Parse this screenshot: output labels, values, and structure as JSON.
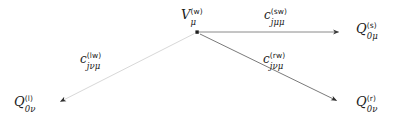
{
  "figure": {
    "kind": "node-link-diagram",
    "background_color": "#ffffff",
    "width": 397,
    "height": 125
  },
  "nodes": [
    {
      "id": "vertex-w",
      "role": "apex-vertex",
      "base": "V",
      "subscript": "μ",
      "superscript": "(w)",
      "label_text": "V",
      "has_dot": true,
      "dot_x": 197,
      "dot_y": 32,
      "label_x": 181,
      "label_y": 8
    },
    {
      "id": "node-s",
      "role": "target",
      "base": "Q",
      "subscript": "0μ",
      "superscript": "(s)",
      "label_text": "Q",
      "has_dot": false,
      "label_x": 356,
      "label_y": 22
    },
    {
      "id": "node-l",
      "role": "target",
      "base": "Q",
      "subscript": "0ν",
      "superscript": "(l)",
      "label_text": "Q",
      "has_dot": false,
      "label_x": 14,
      "label_y": 95
    },
    {
      "id": "node-r",
      "role": "target",
      "base": "Q",
      "subscript": "0ν",
      "superscript": "(r)",
      "label_text": "Q",
      "has_dot": false,
      "label_x": 356,
      "label_y": 95
    }
  ],
  "edges": [
    {
      "id": "edge-sw",
      "from": "vertex-w",
      "to": "node-s",
      "x1": 199,
      "y1": 32,
      "x2": 343,
      "y2": 32,
      "color": "#808080",
      "width": 1.0,
      "arrow": "end",
      "style": "solid",
      "label": {
        "base": "c",
        "subscript": "jμμ",
        "superscript": "(sw)",
        "label_x": 264,
        "label_y": 8
      }
    },
    {
      "id": "edge-lw",
      "from": "vertex-w",
      "to": "node-l",
      "x1": 195,
      "y1": 33,
      "x2": 57,
      "y2": 103,
      "color": "#d3d3d3",
      "width": 1.0,
      "arrow": "end",
      "style": "solid",
      "label": {
        "base": "c",
        "subscript": "jνμ",
        "superscript": "(lw)",
        "label_x": 80,
        "label_y": 52
      }
    },
    {
      "id": "edge-rw",
      "from": "vertex-w",
      "to": "node-r",
      "x1": 200,
      "y1": 34,
      "x2": 340,
      "y2": 102,
      "color": "#737373",
      "width": 1.0,
      "arrow": "end",
      "style": "solid",
      "label": {
        "base": "c",
        "subscript": "jνμ",
        "superscript": "(rw)",
        "label_x": 263,
        "label_y": 52
      }
    }
  ],
  "arrowheads": [
    {
      "id": "arrowhead-s",
      "x": 343,
      "y": 32,
      "edge": "edge-sw"
    },
    {
      "id": "arrowhead-l",
      "x": 55,
      "y": 104,
      "edge": "edge-lw"
    },
    {
      "id": "arrowhead-r",
      "x": 341,
      "y": 103,
      "edge": "edge-rw"
    }
  ]
}
